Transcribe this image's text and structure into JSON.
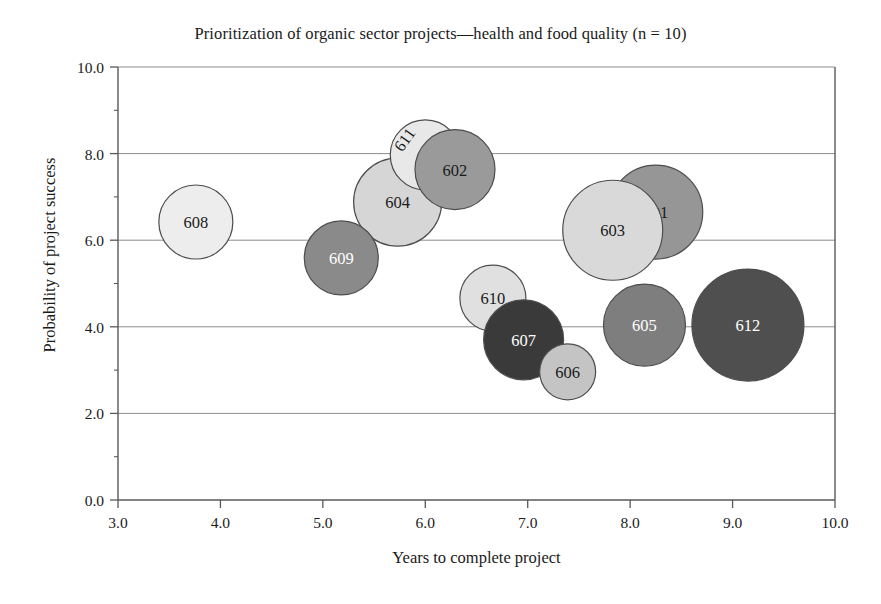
{
  "chart_data": {
    "type": "scatter",
    "title": "Prioritization of organic sector projects—health and food quality (n = 10)",
    "xlabel": "Years to complete project",
    "ylabel": "Probability of project success",
    "xlim": [
      3.0,
      10.0
    ],
    "ylim": [
      0.0,
      10.0
    ],
    "xticks": [
      "3.0",
      "4.0",
      "5.0",
      "6.0",
      "7.0",
      "8.0",
      "9.0",
      "10.0"
    ],
    "xtick_values": [
      3.0,
      4.0,
      5.0,
      6.0,
      7.0,
      8.0,
      9.0,
      10.0
    ],
    "yticks": [
      "0.0",
      "2.0",
      "4.0",
      "6.0",
      "8.0",
      "10.0"
    ],
    "ytick_values": [
      0.0,
      2.0,
      4.0,
      6.0,
      8.0,
      10.0
    ],
    "y_minor_ticks": [
      1.0,
      3.0,
      5.0,
      7.0,
      9.0
    ],
    "grid": "horizontal",
    "grid_color": "#8c8c8c",
    "axis_color": "#595959",
    "bubble_outline_color": "#4d4d4d",
    "legend": "none",
    "bubbles": [
      {
        "label": "601",
        "x": 8.25,
        "y": 6.65,
        "r": 47,
        "fill": "#969696",
        "text_color": "#1a1a1a",
        "rotation": 0,
        "z": 3
      },
      {
        "label": "602",
        "x": 6.29,
        "y": 7.63,
        "r": 40,
        "fill": "#9a9a9a",
        "text_color": "#1a1a1a",
        "rotation": 0,
        "z": 6
      },
      {
        "label": "603",
        "x": 7.83,
        "y": 6.23,
        "r": 50,
        "fill": "#d9d9d9",
        "text_color": "#1a1a1a",
        "rotation": 0,
        "z": 4
      },
      {
        "label": "604",
        "x": 5.73,
        "y": 6.88,
        "r": 44,
        "fill": "#d6d6d6",
        "text_color": "#1a1a1a",
        "rotation": 0,
        "z": 5
      },
      {
        "label": "605",
        "x": 8.14,
        "y": 4.04,
        "r": 41,
        "fill": "#7e7e7e",
        "text_color": "#ffffff",
        "rotation": 0,
        "z": 4
      },
      {
        "label": "606",
        "x": 7.39,
        "y": 2.96,
        "r": 28,
        "fill": "#c4c4c4",
        "text_color": "#1a1a1a",
        "rotation": 0,
        "z": 5
      },
      {
        "label": "607",
        "x": 6.96,
        "y": 3.7,
        "r": 40,
        "fill": "#3a3a3a",
        "text_color": "#ffffff",
        "rotation": 0,
        "z": 4
      },
      {
        "label": "608",
        "x": 3.76,
        "y": 6.42,
        "r": 37,
        "fill": "#ededed",
        "text_color": "#1a1a1a",
        "rotation": 0,
        "z": 2
      },
      {
        "label": "609",
        "x": 5.18,
        "y": 5.59,
        "r": 37,
        "fill": "#8a8a8a",
        "text_color": "#ffffff",
        "rotation": 0,
        "z": 6
      },
      {
        "label": "610",
        "x": 6.66,
        "y": 4.66,
        "r": 33,
        "fill": "#e0e0e0",
        "text_color": "#1a1a1a",
        "rotation": 0,
        "z": 3
      },
      {
        "label": "611",
        "x": 6.0,
        "y": 7.97,
        "r": 35,
        "fill": "#e8e8e8",
        "text_color": "#1a1a1a",
        "rotation": -55,
        "label_dx": -16,
        "label_dy": -18,
        "z": 5
      },
      {
        "label": "612",
        "x": 9.15,
        "y": 4.04,
        "r": 56,
        "fill": "#4f4f4f",
        "text_color": "#ffffff",
        "rotation": 0,
        "z": 3
      }
    ]
  }
}
